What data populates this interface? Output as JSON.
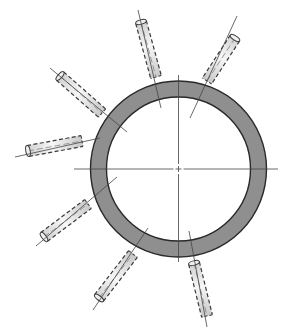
{
  "figure": {
    "description": "Ring cross-section with seven radial cylindrical pins drawn with dashed hidden lines and centre lines",
    "width": 286,
    "height": 332,
    "colors": {
      "background": "#ffffff",
      "ring_fill": "#8f8f8f",
      "ring_stroke": "#2a2a2a",
      "pin_fill_light": "#f2f2f2",
      "pin_fill_dark": "#cfcfcf",
      "pin_stroke": "#3a3a3a",
      "centre_line": "#444444"
    },
    "ring": {
      "cx": 178.5,
      "cy": 169,
      "outer_r": 88,
      "inner_r": 72
    },
    "centre_lines": {
      "horizontal": {
        "x1": 74,
        "y1": 169,
        "x2": 278,
        "y2": 169
      },
      "vertical": {
        "x1": 178.5,
        "y1": 75,
        "x2": 178.5,
        "y2": 262
      }
    },
    "pins": [
      {
        "name": "pin-top",
        "axis": [
          138,
          10,
          161,
          108
        ],
        "body": [
          141,
          22,
          156,
          77
        ],
        "width": 11
      },
      {
        "name": "pin-top-right",
        "axis": [
          237,
          16,
          190,
          118
        ],
        "body": [
          235,
          38,
          207,
          81
        ],
        "width": 11
      },
      {
        "name": "pin-upper-left",
        "axis": [
          50,
          68,
          127,
          132
        ],
        "body": [
          60,
          76,
          102,
          113
        ],
        "width": 11
      },
      {
        "name": "pin-left",
        "axis": [
          15,
          157,
          100,
          138
        ],
        "body": [
          28,
          151,
          82,
          141
        ],
        "width": 11
      },
      {
        "name": "pin-lower-left",
        "axis": [
          36,
          246,
          117,
          177
        ],
        "body": [
          44,
          237,
          88,
          204
        ],
        "width": 11
      },
      {
        "name": "pin-bottom-left",
        "axis": [
          93,
          310,
          148,
          228
        ],
        "body": [
          99,
          298,
          133,
          254
        ],
        "width": 11
      },
      {
        "name": "pin-bottom",
        "axis": [
          189,
          231,
          207,
          327
        ],
        "body": [
          194,
          263,
          207,
          316
        ],
        "width": 11
      }
    ]
  }
}
